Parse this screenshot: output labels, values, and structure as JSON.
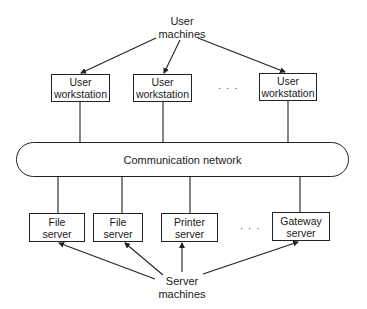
{
  "diagram": {
    "top_label": "User\nmachines",
    "top_label_lines": [
      "User",
      "machines"
    ],
    "network_label": "Communication network",
    "user_workstations": [
      {
        "line1": "User",
        "line2": "workstation"
      },
      {
        "line1": "User",
        "line2": "workstation"
      },
      {
        "line1": "User",
        "line2": "workstation"
      }
    ],
    "servers": [
      {
        "line1": "File",
        "line2": "server"
      },
      {
        "line1": "File",
        "line2": "server"
      },
      {
        "line1": "Printer",
        "line2": "server"
      },
      {
        "line1": "Gateway",
        "line2": "server"
      }
    ],
    "ellipsis": "· · ·",
    "bottom_label_lines": [
      "Server",
      "machines"
    ]
  }
}
